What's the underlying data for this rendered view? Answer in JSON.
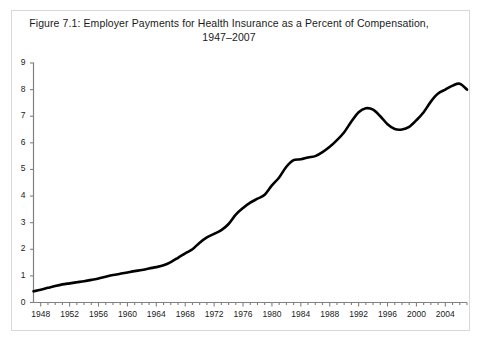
{
  "figure": {
    "title_line1": "Figure 7.1: Employer Payments for Health Insurance as a Percent of Compensation,",
    "title_line2": "1947–2007",
    "border_color": "#d8d8d8",
    "background_color": "#ffffff"
  },
  "chart_data": {
    "type": "line",
    "title": "Figure 7.1: Employer Payments for Health Insurance as a Percent of Compensation, 1947–2007",
    "xlabel": "",
    "ylabel": "",
    "xlim": [
      1947,
      2007
    ],
    "ylim": [
      0,
      9
    ],
    "grid": false,
    "legend": "none",
    "line_color": "#000000",
    "line_width": 2.6,
    "axis_color": "#808080",
    "y_ticks": [
      0,
      1,
      2,
      3,
      4,
      5,
      6,
      7,
      8,
      9
    ],
    "y_tick_labels": [
      "0",
      "1",
      "2",
      "3",
      "4",
      "5",
      "6",
      "7",
      "8",
      "9"
    ],
    "x_ticks_major": [
      1948,
      1952,
      1956,
      1960,
      1964,
      1968,
      1972,
      1976,
      1980,
      1984,
      1988,
      1992,
      1996,
      2000,
      2004
    ],
    "x_tick_labels": [
      "1948",
      "1952",
      "1956",
      "1960",
      "1964",
      "1968",
      "1972",
      "1976",
      "1980",
      "1984",
      "1988",
      "1992",
      "1996",
      "2000",
      "2004"
    ],
    "x_minor_tick_interval": 1,
    "series": [
      {
        "name": "Employer payments for health insurance as percent of compensation",
        "x": [
          1947,
          1948,
          1949,
          1950,
          1951,
          1952,
          1953,
          1954,
          1955,
          1956,
          1957,
          1958,
          1959,
          1960,
          1961,
          1962,
          1963,
          1964,
          1965,
          1966,
          1967,
          1968,
          1969,
          1970,
          1971,
          1972,
          1973,
          1974,
          1975,
          1976,
          1977,
          1978,
          1979,
          1980,
          1981,
          1982,
          1983,
          1984,
          1985,
          1986,
          1987,
          1988,
          1989,
          1990,
          1991,
          1992,
          1993,
          1994,
          1995,
          1996,
          1997,
          1998,
          1999,
          2000,
          2001,
          2002,
          2003,
          2004,
          2005,
          2006,
          2007
        ],
        "y": [
          0.42,
          0.48,
          0.55,
          0.62,
          0.68,
          0.72,
          0.76,
          0.8,
          0.85,
          0.9,
          0.97,
          1.03,
          1.08,
          1.13,
          1.18,
          1.22,
          1.28,
          1.33,
          1.4,
          1.52,
          1.68,
          1.85,
          2.0,
          2.25,
          2.45,
          2.58,
          2.72,
          2.95,
          3.3,
          3.55,
          3.75,
          3.9,
          4.05,
          4.4,
          4.7,
          5.1,
          5.35,
          5.38,
          5.45,
          5.5,
          5.65,
          5.85,
          6.1,
          6.4,
          6.8,
          7.15,
          7.3,
          7.25,
          7.0,
          6.7,
          6.52,
          6.5,
          6.6,
          6.85,
          7.15,
          7.55,
          7.85,
          8.0,
          8.15,
          8.22,
          8.0
        ]
      }
    ]
  }
}
